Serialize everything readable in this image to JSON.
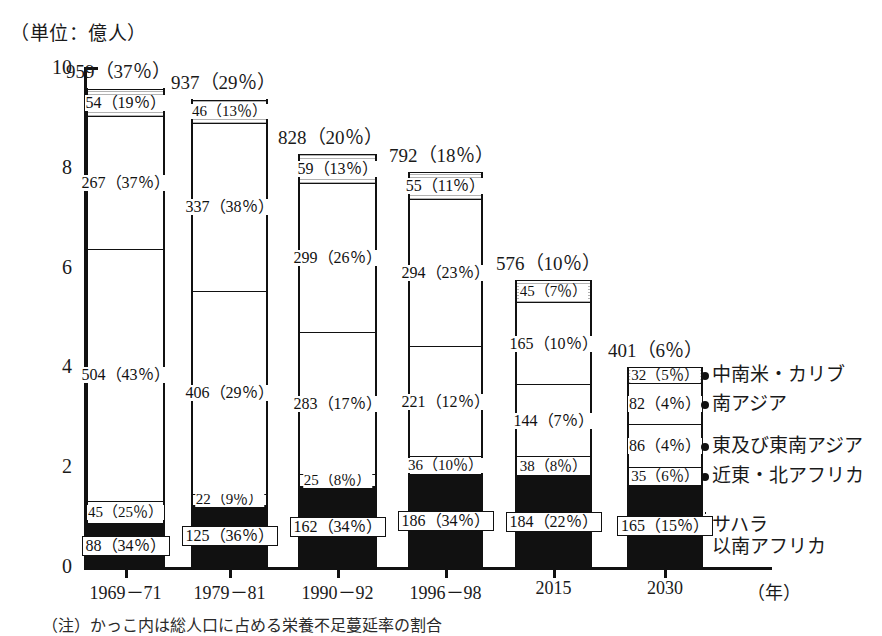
{
  "unit_caption": "（単位：億人）",
  "x_axis_unit": "（年）",
  "bottom_note": "（注）かっこ内は総人口に占める栄養不足蔓延率の割合",
  "axis": {
    "y_ticks": [
      "0",
      "2",
      "4",
      "6",
      "8",
      "10"
    ],
    "x_categories": [
      "1969－71",
      "1979－81",
      "1990－92",
      "1996－98",
      "2015",
      "2030"
    ]
  },
  "legend": {
    "items": [
      {
        "name": "latin-america-caribbean",
        "label": "中南米・カリブ"
      },
      {
        "name": "south-asia",
        "label": "南アジア"
      },
      {
        "name": "east-southeast-asia",
        "label": "東及び東南アジア"
      },
      {
        "name": "near-east-north-africa",
        "label": "近東・北アフリカ"
      },
      {
        "name": "sub-saharan-africa",
        "label": "サハラ\n以南アフリカ"
      }
    ]
  },
  "chart_data": {
    "type": "bar",
    "subtype": "stacked-bar",
    "title": "",
    "xlabel": "（年）",
    "ylabel": "（単位：億人）",
    "ylim": [
      0,
      10
    ],
    "yticks": [
      0,
      2,
      4,
      6,
      8,
      10
    ],
    "grid": false,
    "legend_position": "right",
    "categories": [
      "1969－71",
      "1979－81",
      "1990－92",
      "1996－98",
      "2015",
      "2030"
    ],
    "totals": [
      {
        "value": 959,
        "pct": 37,
        "label": "959（37％）"
      },
      {
        "value": 937,
        "pct": 29,
        "label": "937（29％）"
      },
      {
        "value": 828,
        "pct": 20,
        "label": "828（20％）"
      },
      {
        "value": 792,
        "pct": 18,
        "label": "792（18％）"
      },
      {
        "value": 576,
        "pct": 10,
        "label": "576（10％）"
      },
      {
        "value": 401,
        "pct": 6,
        "label": "401（6％）"
      }
    ],
    "series": [
      {
        "name": "サハラ以南アフリカ",
        "key": "sub-saharan-africa",
        "fill": "black",
        "values": [
          88,
          125,
          162,
          186,
          184,
          165
        ],
        "pct": [
          34,
          36,
          34,
          34,
          22,
          15
        ],
        "labels": [
          "88（34％）",
          "125（36％）",
          "162（34％）",
          "186（34％）",
          "184（22％）",
          "165（15％）"
        ]
      },
      {
        "name": "近東・北アフリカ",
        "key": "near-east-north-africa",
        "fill": "white",
        "values": [
          45,
          22,
          25,
          36,
          38,
          35
        ],
        "pct": [
          25,
          9,
          8,
          10,
          8,
          6
        ],
        "labels": [
          "45（25％）",
          "22（9％）",
          "25（8％）",
          "36（10％）",
          "38（8％）",
          "35（6％）"
        ]
      },
      {
        "name": "東及び東南アジア",
        "key": "east-southeast-asia",
        "fill": "white",
        "values": [
          504,
          406,
          283,
          221,
          144,
          86
        ],
        "pct": [
          43,
          29,
          17,
          12,
          7,
          4
        ],
        "labels": [
          "504（43％）",
          "406（29％）",
          "283（17％）",
          "221（12％）",
          "144（7％）",
          "86（4％）"
        ]
      },
      {
        "name": "南アジア",
        "key": "south-asia",
        "fill": "white",
        "values": [
          267,
          337,
          299,
          294,
          165,
          82
        ],
        "pct": [
          37,
          38,
          26,
          23,
          10,
          4
        ],
        "labels": [
          "267（37％）",
          "337（38％）",
          "299（26％）",
          "294（23％）",
          "165（10％）",
          "82（4％）"
        ]
      },
      {
        "name": "中南米・カリブ",
        "key": "latin-america-caribbean",
        "fill": "hatch",
        "values": [
          54,
          46,
          59,
          55,
          45,
          32
        ],
        "pct": [
          19,
          13,
          13,
          11,
          7,
          5
        ],
        "labels": [
          "54（19％）",
          "46（13％）",
          "59（13％）",
          "55（11％）",
          "45（7％）",
          "32（5％）"
        ]
      }
    ]
  },
  "colors": {
    "ink": "#111111",
    "paper": "#ffffff"
  }
}
